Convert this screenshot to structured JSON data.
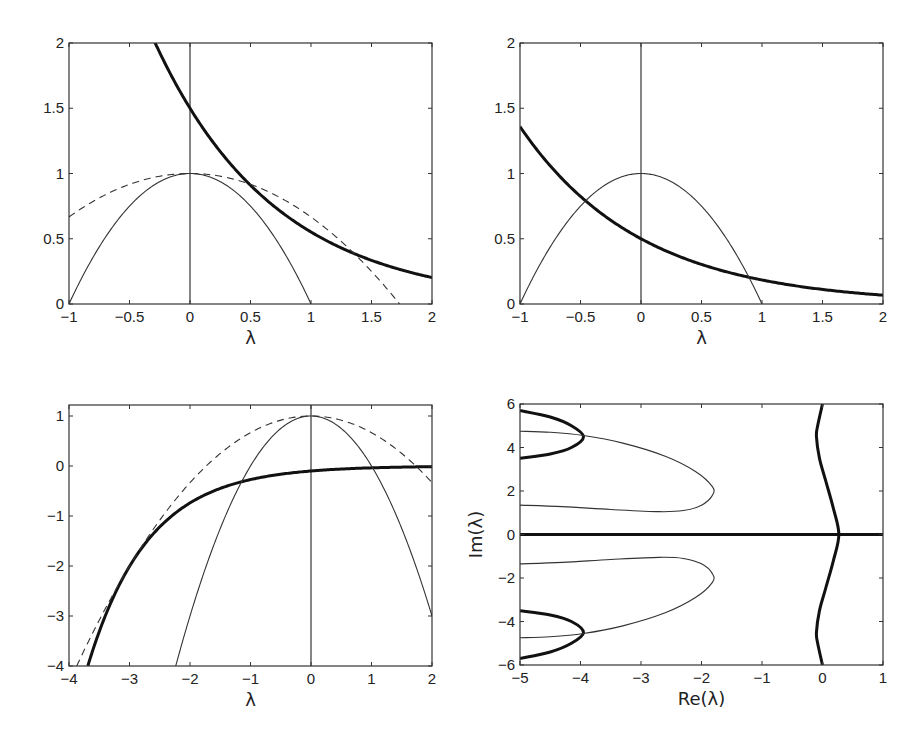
{
  "chart_data": [
    {
      "id": "top-left",
      "type": "line",
      "title": "",
      "xlabel": "λ",
      "ylabel": "",
      "xlim": [
        -1,
        2
      ],
      "ylim": [
        0,
        2
      ],
      "xticks": [
        -1,
        -0.5,
        0,
        0.5,
        1,
        1.5,
        2
      ],
      "xtick_labels": [
        "−1",
        "−0.5",
        "0",
        "0.5",
        "1",
        "1.5",
        "2"
      ],
      "yticks": [
        0,
        0.5,
        1,
        1.5,
        2
      ],
      "ytick_labels": [
        "0",
        "0.5",
        "1",
        "1.5",
        "2"
      ],
      "grid": false,
      "vertical_line_x": 0,
      "box": {
        "left": 69,
        "top": 43,
        "right": 432,
        "bottom": 304
      },
      "series": [
        {
          "name": "thick curve",
          "style": "bold",
          "x": [
            -0.27,
            0,
            0.25,
            0.5,
            0.75,
            1,
            1.25,
            1.5,
            1.75,
            2
          ],
          "values": [
            1.97,
            1.5,
            1.17,
            0.91,
            0.71,
            0.55,
            0.43,
            0.33,
            0.26,
            0.2
          ]
        },
        {
          "name": "thin parabola",
          "style": "thin",
          "x": [
            -1,
            -0.75,
            -0.5,
            -0.25,
            0,
            0.25,
            0.5,
            0.75,
            1
          ],
          "values": [
            0,
            0.44,
            0.75,
            0.94,
            1,
            0.94,
            0.75,
            0.44,
            0
          ]
        },
        {
          "name": "dashed curve",
          "style": "dashed",
          "x": [
            -1,
            -0.5,
            0,
            0.5,
            1,
            1.5,
            1.73
          ],
          "values": [
            0.67,
            0.92,
            1,
            0.92,
            0.67,
            0.25,
            0
          ]
        }
      ],
      "curves": [
        {
          "style": "bold",
          "fn": "1.5*exp(-x)",
          "xmin": -0.3,
          "xmax": 2
        },
        {
          "style": "thin",
          "fn": "1-x*x",
          "xmin": -1,
          "xmax": 1
        },
        {
          "style": "dashed",
          "fn": "1-x*x/3",
          "xmin": -1,
          "xmax": 1.7321
        }
      ]
    },
    {
      "id": "top-right",
      "type": "line",
      "title": "",
      "xlabel": "λ",
      "ylabel": "",
      "xlim": [
        -1,
        2
      ],
      "ylim": [
        0,
        2
      ],
      "xticks": [
        -1,
        -0.5,
        0,
        0.5,
        1,
        1.5,
        2
      ],
      "xtick_labels": [
        "−1",
        "−0.5",
        "0",
        "0.5",
        "1",
        "1.5",
        "2"
      ],
      "yticks": [
        0,
        0.5,
        1,
        1.5,
        2
      ],
      "ytick_labels": [
        "0",
        "0.5",
        "1",
        "1.5",
        "2"
      ],
      "grid": false,
      "vertical_line_x": 0,
      "box": {
        "left": 520,
        "top": 43,
        "right": 883,
        "bottom": 304
      },
      "series": [
        {
          "name": "thick curve",
          "style": "bold",
          "x": [
            -1,
            -0.5,
            0,
            0.5,
            1,
            1.5,
            2
          ],
          "values": [
            1.36,
            0.82,
            0.5,
            0.3,
            0.18,
            0.11,
            0.07
          ]
        },
        {
          "name": "thin parabola",
          "style": "thin",
          "x": [
            -1,
            -0.5,
            0,
            0.5,
            1
          ],
          "values": [
            0,
            0.75,
            1,
            0.75,
            0
          ]
        }
      ],
      "curves": [
        {
          "style": "bold",
          "fn": "0.5*exp(-x)",
          "xmin": -1,
          "xmax": 2
        },
        {
          "style": "thin",
          "fn": "1-x*x",
          "xmin": -1,
          "xmax": 1
        }
      ]
    },
    {
      "id": "bottom-left",
      "type": "line",
      "title": "",
      "xlabel": "λ",
      "ylabel": "",
      "xlim": [
        -4,
        2
      ],
      "ylim": [
        -4,
        1.22
      ],
      "xticks": [
        -4,
        -3,
        -2,
        -1,
        0,
        1,
        2
      ],
      "xtick_labels": [
        "−4",
        "−3",
        "−2",
        "−1",
        "0",
        "1",
        "2"
      ],
      "yticks": [
        -4,
        -3,
        -2,
        -1,
        0,
        1
      ],
      "ytick_labels": [
        "−4",
        "−3",
        "−2",
        "−1",
        "0",
        "1"
      ],
      "grid": false,
      "vertical_line_x": 0,
      "box": {
        "left": 69,
        "top": 405,
        "right": 432,
        "bottom": 666
      },
      "series": [
        {
          "name": "thick curve",
          "style": "bold",
          "x": [
            -3.64,
            -3,
            -2,
            -1,
            0,
            1,
            2
          ],
          "values": [
            -4,
            -2.01,
            -0.74,
            -0.27,
            -0.1,
            -0.04,
            -0.01
          ]
        },
        {
          "name": "thin parabola",
          "style": "thin",
          "x": [
            -2.24,
            -2,
            -1,
            0,
            1,
            2
          ],
          "values": [
            -4,
            -3,
            0,
            1,
            0,
            -3
          ]
        },
        {
          "name": "dashed curve",
          "style": "dashed",
          "x": [
            -3.87,
            -3,
            -2,
            -1,
            0,
            1,
            2
          ],
          "values": [
            -4,
            -2,
            -0.33,
            0.67,
            1,
            0.67,
            -0.33
          ]
        }
      ],
      "curves": [
        {
          "style": "bold",
          "fn": "-0.1*exp(-x)",
          "xmin": -3.689,
          "xmax": 2
        },
        {
          "style": "thin",
          "fn": "1-x*x",
          "xmin": -2.236,
          "xmax": 2
        },
        {
          "style": "dashed",
          "fn": "1-x*x/3",
          "xmin": -3.873,
          "xmax": 2
        }
      ]
    },
    {
      "id": "bottom-right",
      "type": "line",
      "title": "",
      "xlabel": "Re(λ)",
      "ylabel": "Im(λ)",
      "xlim": [
        -5,
        1
      ],
      "ylim": [
        -6,
        6
      ],
      "xticks": [
        -5,
        -4,
        -3,
        -2,
        -1,
        0,
        1
      ],
      "xtick_labels": [
        "−5",
        "−4",
        "−3",
        "−2",
        "−1",
        "0",
        "1"
      ],
      "yticks": [
        -6,
        -4,
        -2,
        0,
        2,
        4,
        6
      ],
      "ytick_labels": [
        "−6",
        "−4",
        "−2",
        "0",
        "2",
        "4",
        "6"
      ],
      "grid": false,
      "box": {
        "left": 520,
        "top": 404,
        "right": 883,
        "bottom": 665
      },
      "series": [
        {
          "name": "real axis (thick)",
          "style": "bold",
          "points": [
            [
              -5,
              0
            ],
            [
              1,
              0
            ]
          ]
        },
        {
          "name": "right wavy branch (thick)",
          "style": "bold",
          "points": [
            [
              0,
              6
            ],
            [
              -0.08,
              5
            ],
            [
              -0.1,
              4.5
            ],
            [
              -0.05,
              3.5
            ],
            [
              0.05,
              2.5
            ],
            [
              0.18,
              1.2
            ],
            [
              0.27,
              0
            ],
            [
              0.18,
              -1.2
            ],
            [
              0.05,
              -2.5
            ],
            [
              -0.05,
              -3.5
            ],
            [
              -0.1,
              -4.5
            ],
            [
              -0.08,
              -5
            ],
            [
              0,
              -6
            ]
          ]
        },
        {
          "name": "upper thick loop",
          "style": "bold",
          "points": [
            [
              -5,
              5.7
            ],
            [
              -4.5,
              5.4
            ],
            [
              -4.15,
              5.0
            ],
            [
              -3.95,
              4.5
            ],
            [
              -4.15,
              4.0
            ],
            [
              -4.5,
              3.7
            ],
            [
              -5,
              3.5
            ]
          ]
        },
        {
          "name": "lower thick loop",
          "style": "bold",
          "points": [
            [
              -5,
              -3.5
            ],
            [
              -4.5,
              -3.7
            ],
            [
              -4.15,
              -4.0
            ],
            [
              -3.95,
              -4.5
            ],
            [
              -4.15,
              -5.0
            ],
            [
              -4.5,
              -5.4
            ],
            [
              -5,
              -5.7
            ]
          ]
        },
        {
          "name": "upper thin loop",
          "style": "thin",
          "points": [
            [
              -5,
              4.75
            ],
            [
              -4.5,
              4.7
            ],
            [
              -3.95,
              4.55
            ],
            [
              -3.3,
              4.2
            ],
            [
              -2.6,
              3.6
            ],
            [
              -2.1,
              2.9
            ],
            [
              -1.82,
              2.2
            ],
            [
              -1.82,
              1.8
            ],
            [
              -2.0,
              1.35
            ],
            [
              -2.3,
              1.1
            ],
            [
              -2.7,
              1.05
            ],
            [
              -3.5,
              1.15
            ],
            [
              -4.3,
              1.28
            ],
            [
              -5,
              1.35
            ]
          ]
        },
        {
          "name": "lower thin loop",
          "style": "thin",
          "points": [
            [
              -5,
              -1.35
            ],
            [
              -4.3,
              -1.28
            ],
            [
              -3.5,
              -1.15
            ],
            [
              -2.7,
              -1.05
            ],
            [
              -2.3,
              -1.1
            ],
            [
              -2.0,
              -1.35
            ],
            [
              -1.82,
              -1.8
            ],
            [
              -1.82,
              -2.2
            ],
            [
              -2.1,
              -2.9
            ],
            [
              -2.6,
              -3.6
            ],
            [
              -3.3,
              -4.2
            ],
            [
              -3.95,
              -4.55
            ],
            [
              -4.5,
              -4.7
            ],
            [
              -5,
              -4.75
            ]
          ]
        }
      ]
    }
  ]
}
